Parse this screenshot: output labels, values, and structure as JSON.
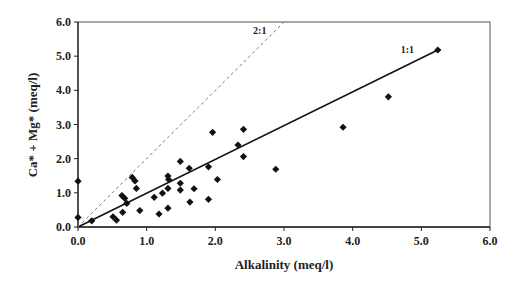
{
  "chart_data": {
    "type": "scatter",
    "title": "",
    "xlabel": "Alkalinity (meq/l)",
    "ylabel": "Ca* + Mg* (meq/l)",
    "xlim": [
      0,
      6
    ],
    "ylim": [
      0,
      6
    ],
    "xticks": [
      "0.0",
      "1.0",
      "2.0",
      "3.0",
      "4.0",
      "5.0",
      "6.0"
    ],
    "yticks": [
      "0.0",
      "1.0",
      "2.0",
      "3.0",
      "4.0",
      "5.0",
      "6.0"
    ],
    "grid": false,
    "legend": null,
    "series": [
      {
        "name": "samples",
        "marker": "diamond",
        "color": "#111111",
        "points": [
          [
            0.0,
            1.34
          ],
          [
            0.0,
            0.28
          ],
          [
            0.2,
            0.18
          ],
          [
            0.51,
            0.3
          ],
          [
            0.56,
            0.2
          ],
          [
            0.64,
            0.92
          ],
          [
            0.68,
            0.84
          ],
          [
            0.71,
            0.69
          ],
          [
            0.65,
            0.43
          ],
          [
            0.79,
            1.45
          ],
          [
            0.83,
            1.35
          ],
          [
            0.85,
            1.13
          ],
          [
            0.9,
            0.48
          ],
          [
            1.11,
            0.87
          ],
          [
            1.18,
            0.38
          ],
          [
            1.23,
            0.99
          ],
          [
            1.31,
            1.49
          ],
          [
            1.32,
            1.39
          ],
          [
            1.31,
            1.13
          ],
          [
            1.31,
            0.55
          ],
          [
            1.49,
            1.92
          ],
          [
            1.49,
            1.28
          ],
          [
            1.49,
            1.08
          ],
          [
            1.62,
            1.72
          ],
          [
            1.63,
            0.73
          ],
          [
            1.69,
            1.12
          ],
          [
            1.9,
            1.76
          ],
          [
            1.9,
            0.81
          ],
          [
            1.96,
            2.77
          ],
          [
            2.03,
            1.39
          ],
          [
            2.33,
            2.4
          ],
          [
            2.41,
            2.86
          ],
          [
            2.41,
            2.06
          ],
          [
            2.88,
            1.69
          ],
          [
            3.86,
            2.92
          ],
          [
            4.52,
            3.81
          ],
          [
            5.24,
            5.18
          ]
        ]
      }
    ],
    "reference_lines": [
      {
        "name": "1:1",
        "label": "1:1",
        "style": "solid",
        "from": [
          0,
          0
        ],
        "to": [
          5.24,
          5.18
        ],
        "label_at": [
          4.7,
          5.1
        ]
      },
      {
        "name": "2:1",
        "label": "2:1",
        "style": "dashed",
        "from": [
          0,
          0
        ],
        "to": [
          3.0,
          6.0
        ],
        "label_at": [
          2.55,
          5.65
        ]
      }
    ]
  }
}
